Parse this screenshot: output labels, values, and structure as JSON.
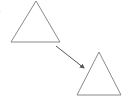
{
  "diagram": {
    "label": ".",
    "stroke_color": "#8a8a8a",
    "arrow_color": "#555555",
    "shapes": [
      {
        "type": "triangle",
        "name": "triangle-original",
        "points": "36,1 11,42 60,42"
      },
      {
        "type": "triangle",
        "name": "triangle-transformed",
        "points": "99,52 77,95 121,95"
      }
    ],
    "arrow": {
      "x1": 56,
      "y1": 46,
      "x2": 84,
      "y2": 68
    }
  }
}
